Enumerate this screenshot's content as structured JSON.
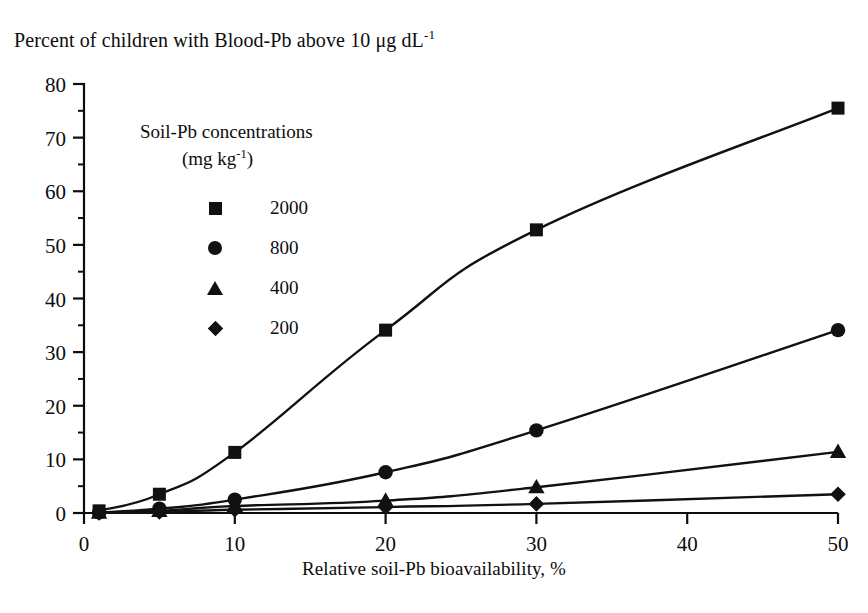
{
  "chart_data": {
    "type": "line",
    "title": "Percent of children with Blood-Pb above 10 μg dL",
    "title_sup": "-1",
    "xlabel": "Relative soil-Pb bioavailability, %",
    "ylabel": "",
    "xlim": [
      0,
      50
    ],
    "ylim": [
      0,
      80
    ],
    "xticks": [
      0,
      10,
      20,
      30,
      40,
      50
    ],
    "yticks": [
      0,
      10,
      20,
      30,
      40,
      50,
      60,
      70,
      80
    ],
    "y_minor_ticks": [
      5,
      15,
      25,
      35,
      45,
      55,
      65,
      75
    ],
    "grid": false,
    "legend_position": "upper-left-inside",
    "legend_title": "Soil-Pb concentrations",
    "legend_title_line2": "(mg kg",
    "legend_title_line2_sup": "-1",
    "legend_title_line2_end": ")",
    "x": [
      1,
      5,
      10,
      20,
      30,
      50
    ],
    "series": [
      {
        "name": "2000",
        "marker": "square",
        "color": "#111111",
        "values": [
          0.4,
          3.5,
          11.3,
          34.1,
          52.8,
          75.5
        ]
      },
      {
        "name": "800",
        "marker": "circle",
        "color": "#111111",
        "values": [
          0.1,
          0.8,
          2.5,
          7.6,
          15.4,
          34.1
        ]
      },
      {
        "name": "400",
        "marker": "triangle",
        "color": "#111111",
        "values": [
          0.05,
          0.4,
          1.3,
          2.3,
          4.8,
          11.4
        ]
      },
      {
        "name": "200",
        "marker": "diamond",
        "color": "#111111",
        "values": [
          0.02,
          0.2,
          0.6,
          1.1,
          1.7,
          3.5
        ]
      }
    ]
  },
  "axis": {
    "x_tick_labels": [
      "0",
      "10",
      "20",
      "30",
      "40",
      "50"
    ],
    "y_tick_labels": [
      "0",
      "10",
      "20",
      "30",
      "40",
      "50",
      "60",
      "70",
      "80"
    ]
  },
  "legend": {
    "title": "Soil-Pb concentrations",
    "units_prefix": "(mg kg",
    "units_sup": "-1",
    "units_suffix": ")",
    "items": [
      {
        "label": "2000",
        "marker": "square"
      },
      {
        "label": "800",
        "marker": "circle"
      },
      {
        "label": "400",
        "marker": "triangle"
      },
      {
        "label": "200",
        "marker": "diamond"
      }
    ]
  },
  "title": {
    "prefix": "Percent of children with Blood-Pb above 10 μg dL",
    "sup": "-1"
  }
}
